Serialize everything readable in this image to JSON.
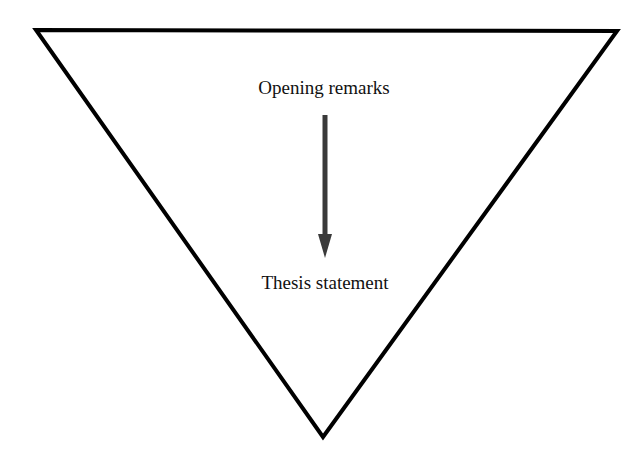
{
  "diagram": {
    "type": "inverted-funnel",
    "top_label": "Opening remarks",
    "bottom_label": "Thesis statement",
    "arrow_direction": "down",
    "colors": {
      "outline": "#000000",
      "arrow": "#3a3a3a",
      "text": "#111111",
      "background": "#ffffff"
    }
  }
}
